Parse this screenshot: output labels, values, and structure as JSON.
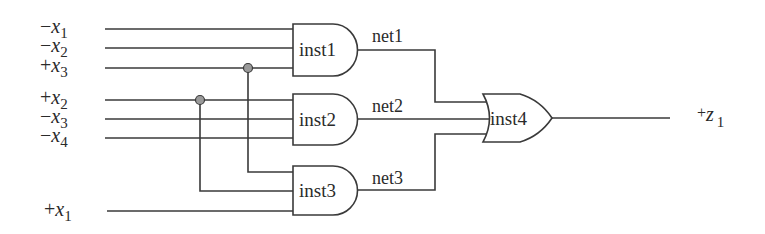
{
  "diagram": {
    "type": "logic-circuit",
    "inputs": [
      {
        "sign": "−",
        "var": "x",
        "sub": "1",
        "y": 29
      },
      {
        "sign": "−",
        "var": "x",
        "sub": "2",
        "y": 48
      },
      {
        "sign": "+",
        "var": "x",
        "sub": "3",
        "y": 68
      },
      {
        "sign": "+",
        "var": "x",
        "sub": "2",
        "y": 100
      },
      {
        "sign": "−",
        "var": "x",
        "sub": "3",
        "y": 119
      },
      {
        "sign": "−",
        "var": "x",
        "sub": "4",
        "y": 138
      },
      {
        "sign": "+",
        "var": "x",
        "sub": "1",
        "y": 212
      }
    ],
    "gates": [
      {
        "name": "inst1",
        "kind": "AND"
      },
      {
        "name": "inst2",
        "kind": "AND"
      },
      {
        "name": "inst3",
        "kind": "AND"
      },
      {
        "name": "inst4",
        "kind": "OR"
      }
    ],
    "nets": [
      "net1",
      "net2",
      "net3"
    ],
    "output": {
      "sign": "+",
      "var": "z",
      "sub": "1"
    },
    "colors": {
      "wire": "#3a3a3a",
      "junction": "#9a9a9a"
    }
  }
}
